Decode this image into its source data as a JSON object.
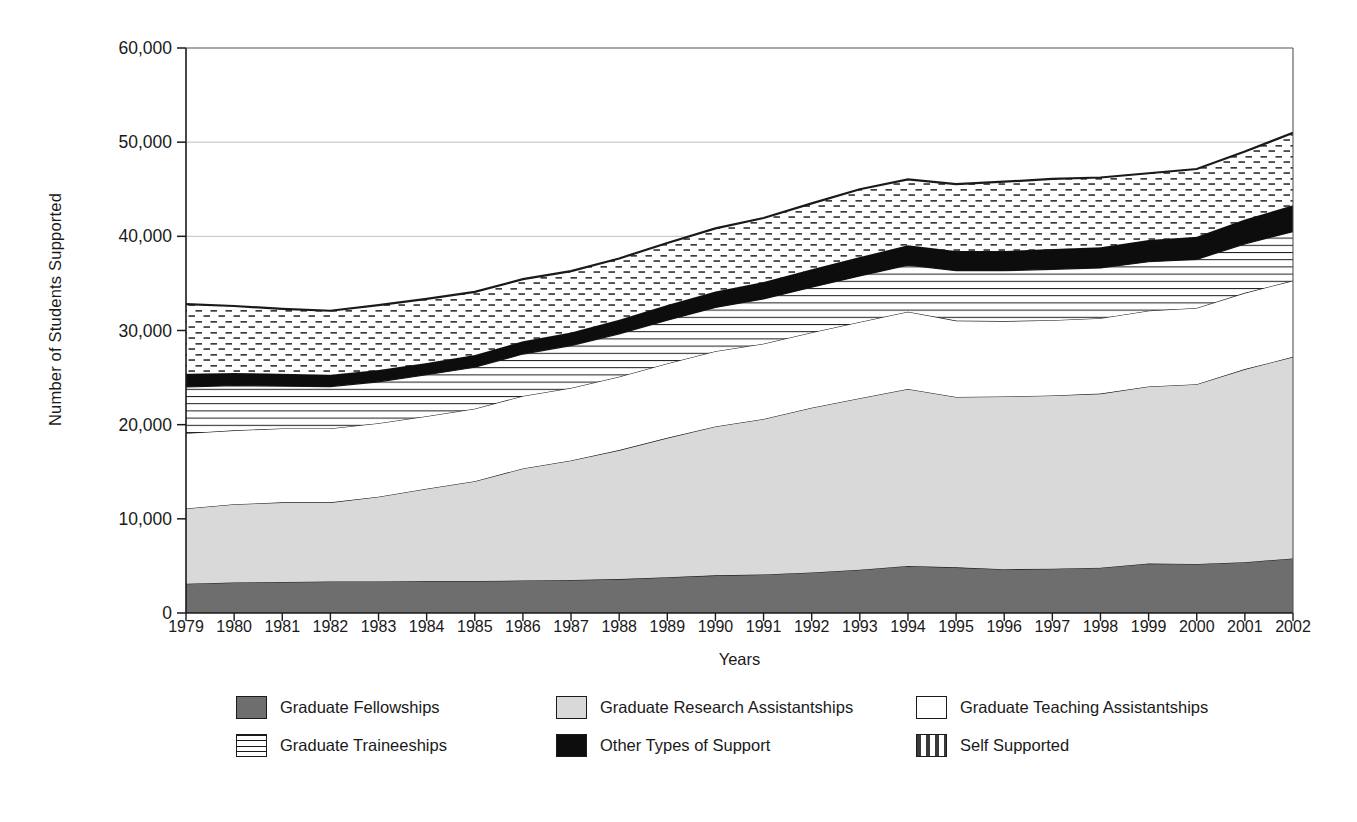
{
  "chart_data": {
    "type": "area",
    "stacked": true,
    "title": "",
    "xlabel": "Years",
    "ylabel": "Number of Students Supported",
    "ylim": [
      0,
      60000
    ],
    "yticks": [
      "0",
      "10,000",
      "20,000",
      "30,000",
      "40,000",
      "50,000",
      "60,000"
    ],
    "ytick_values": [
      0,
      10000,
      20000,
      30000,
      40000,
      50000,
      60000
    ],
    "grid": "horizontal",
    "legend_position": "bottom",
    "categories": [
      "1979",
      "1980",
      "1981",
      "1982",
      "1983",
      "1984",
      "1985",
      "1986",
      "1987",
      "1988",
      "1989",
      "1990",
      "1991",
      "1992",
      "1993",
      "1994",
      "1995",
      "1996",
      "1997",
      "1998",
      "1999",
      "2000",
      "2001",
      "2002"
    ],
    "series": [
      {
        "name": "Graduate Fellowships",
        "fill": "solid-dark-gray",
        "color": "#6e6e6e",
        "values": [
          3100,
          3250,
          3300,
          3350,
          3350,
          3400,
          3400,
          3450,
          3500,
          3600,
          3800,
          4000,
          4100,
          4300,
          4600,
          5000,
          4850,
          4650,
          4700,
          4800,
          5250,
          5200,
          5400,
          5800
        ]
      },
      {
        "name": "Graduate Research Assistantships",
        "fill": "solid-light-gray",
        "color": "#d9d9d9",
        "values": [
          8000,
          8300,
          8450,
          8400,
          9000,
          9800,
          10600,
          11900,
          12700,
          13700,
          14800,
          15800,
          16500,
          17500,
          18200,
          18800,
          18100,
          18350,
          18400,
          18500,
          18800,
          19100,
          20500,
          21400
        ]
      },
      {
        "name": "Graduate Teaching Assistantships",
        "fill": "white",
        "color": "#ffffff",
        "values": [
          8000,
          7850,
          7850,
          7850,
          7800,
          7700,
          7700,
          7700,
          7700,
          7800,
          7900,
          8000,
          8000,
          8000,
          8100,
          8200,
          8100,
          8000,
          8000,
          8000,
          8050,
          8100,
          8100,
          8100
        ]
      },
      {
        "name": "Graduate Traineeships",
        "fill": "horizontal-lines",
        "color": "#ffffff",
        "values": [
          4900,
          4750,
          4500,
          4450,
          4400,
          4400,
          4400,
          4450,
          4500,
          4550,
          4600,
          4650,
          4750,
          4800,
          4900,
          4950,
          5300,
          5350,
          5400,
          5350,
          5200,
          5150,
          5200,
          5200
        ]
      },
      {
        "name": "Other Types of Support",
        "fill": "solid-black",
        "color": "#0d0d0d",
        "values": [
          1400,
          1350,
          1300,
          1250,
          1250,
          1250,
          1300,
          1350,
          1400,
          1500,
          1600,
          1700,
          1800,
          1900,
          2000,
          2100,
          2100,
          2100,
          2150,
          2200,
          2300,
          2400,
          2600,
          2800
        ]
      },
      {
        "name": "Self Supported",
        "fill": "dashed-dots",
        "color": "#ffffff",
        "values": [
          7400,
          7100,
          6900,
          6800,
          6900,
          6800,
          6700,
          6600,
          6500,
          6500,
          6600,
          6700,
          6800,
          7000,
          7200,
          7000,
          7100,
          7350,
          7450,
          7400,
          7100,
          7200,
          7200,
          7700
        ]
      }
    ],
    "stacked_tops": {
      "1979": [
        3100,
        11100,
        19100,
        24000,
        25400,
        32800
      ],
      "1994": [
        5000,
        23800,
        32000,
        36950,
        39050,
        46050
      ],
      "2002": [
        5800,
        27200,
        35300,
        40500,
        43300,
        51000
      ]
    }
  },
  "legend": {
    "rows": [
      [
        {
          "label": "Graduate Fellowships",
          "swatch": "sw-fellow",
          "icon": "legend-swatch-fellowships"
        },
        {
          "label": "Graduate Research Assistantships",
          "swatch": "sw-ra",
          "icon": "legend-swatch-research-assistantships"
        },
        {
          "label": "Graduate Teaching Assistantships",
          "swatch": "sw-ta",
          "icon": "legend-swatch-teaching-assistantships"
        }
      ],
      [
        {
          "label": "Graduate Traineeships",
          "swatch": "sw-train",
          "icon": "legend-swatch-traineeships"
        },
        {
          "label": "Other Types of Support",
          "swatch": "sw-other",
          "icon": "legend-swatch-other-support"
        },
        {
          "label": "Self Supported",
          "swatch": "sw-self",
          "icon": "legend-swatch-self-supported"
        }
      ]
    ]
  },
  "colors": {
    "fellowships": "#6e6e6e",
    "research_assistantships": "#d9d9d9",
    "teaching_assistantships": "#ffffff",
    "traineeships": "#ffffff",
    "other_support": "#0d0d0d",
    "self_supported": "#ffffff",
    "axis": "#1a1a1a",
    "grid": "#b8b8b8"
  }
}
